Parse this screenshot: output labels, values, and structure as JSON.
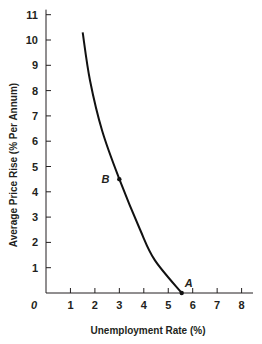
{
  "chart_data": {
    "type": "line",
    "title": "",
    "xlabel": "Unemployment Rate (%)",
    "ylabel": "Average Price Rise (% Per Annum)",
    "xlim": [
      0,
      8.5
    ],
    "ylim": [
      0,
      11
    ],
    "x_ticks": [
      1,
      2,
      3,
      4,
      5,
      6,
      7,
      8
    ],
    "y_ticks": [
      1,
      2,
      3,
      4,
      5,
      6,
      7,
      8,
      9,
      10,
      11
    ],
    "origin_label": "0",
    "grid": false,
    "legend": null,
    "series": [
      {
        "name": "Phillips Curve",
        "x": [
          1.5,
          1.8,
          2.3,
          3.0,
          3.85,
          4.45,
          5.55
        ],
        "y": [
          10.3,
          8.4,
          6.4,
          4.5,
          2.5,
          1.3,
          0
        ]
      }
    ],
    "annotations": [
      {
        "label": "A",
        "x": 5.55,
        "y": 0
      },
      {
        "label": "B",
        "x": 3.0,
        "y": 4.5
      }
    ],
    "colors": {
      "curve": "#111111",
      "axis": "#231f20",
      "text": "#231f20"
    }
  }
}
